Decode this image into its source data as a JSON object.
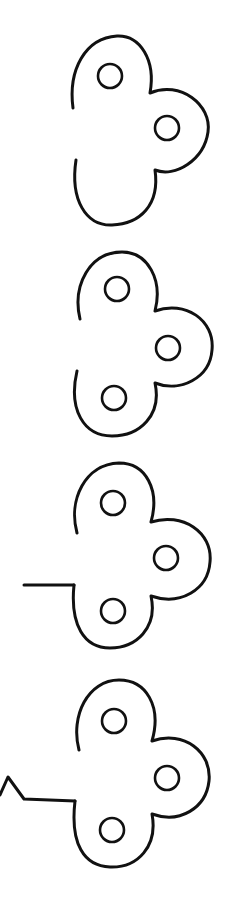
{
  "diagram": {
    "title": "",
    "colors": {
      "stroke": "#111111",
      "background": "#ffffff"
    },
    "figures": [
      {
        "index": 1,
        "holes": 2,
        "stem": "none",
        "lobes": 3,
        "left_side": "open gap"
      },
      {
        "index": 2,
        "holes": 3,
        "stem": "none",
        "lobes": 3,
        "left_side": "open gap"
      },
      {
        "index": 3,
        "holes": 3,
        "stem": "straight horizontal line",
        "lobes": 3,
        "left_side": "gap with stem from lower-left"
      },
      {
        "index": 4,
        "holes": 3,
        "stem": "horizontal line ending in zigzag",
        "lobes": 3,
        "left_side": "gap with zigzag stem from lower-left"
      }
    ]
  }
}
